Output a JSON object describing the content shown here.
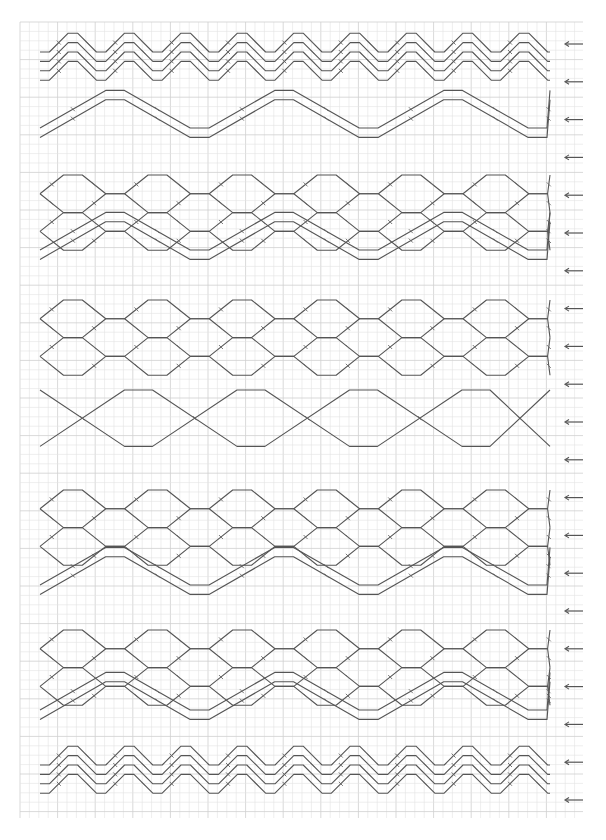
{
  "diagram": {
    "type": "braid-threading-pattern",
    "colors": {
      "thread": "#555555",
      "grid_minor": "#e2e2e2",
      "grid_major": "#cfcfcf",
      "background": "#ffffff"
    },
    "arrow_direction": "left",
    "arrow_count": 21,
    "bands": [
      {
        "name": "top-zigzag",
        "kind": "zigzag",
        "threads": 4
      },
      {
        "name": "wide-wave-1",
        "kind": "wide-wave",
        "threads": 2
      },
      {
        "name": "diamond-lattice-1",
        "kind": "diamond",
        "threads": 4
      },
      {
        "name": "wide-wave-2",
        "kind": "wide-wave",
        "threads": 2
      },
      {
        "name": "diamond-lattice-2",
        "kind": "diamond",
        "threads": 4
      },
      {
        "name": "large-diamond",
        "kind": "large-diamond",
        "threads": 2
      },
      {
        "name": "diamond-lattice-3",
        "kind": "diamond",
        "threads": 4
      },
      {
        "name": "wide-wave-3",
        "kind": "wide-wave",
        "threads": 2
      },
      {
        "name": "diamond-lattice-4",
        "kind": "diamond",
        "threads": 4
      },
      {
        "name": "wide-wave-4",
        "kind": "wide-wave",
        "threads": 2
      },
      {
        "name": "bottom-zigzag",
        "kind": "zigzag",
        "threads": 4
      }
    ]
  }
}
